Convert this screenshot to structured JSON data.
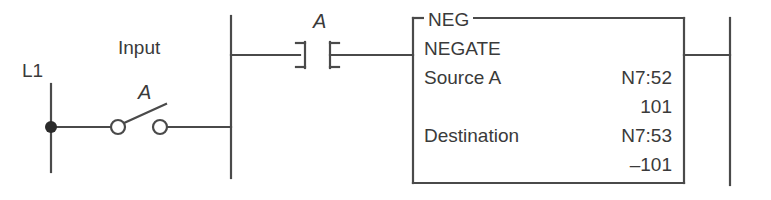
{
  "diagram": {
    "stroke_color": "#4a4a4a",
    "text_color": "#3a3a3a",
    "background_color": "#ffffff"
  },
  "field_circuit": {
    "power_rail_label": "L1",
    "input_label": "Input",
    "switch_label": "A",
    "switch_type": "normally-open-toggle-switch",
    "terminal_dot": "filled-junction-dot"
  },
  "rung": {
    "contact_label": "A",
    "contact_type": "examine-if-closed"
  },
  "instruction_block": {
    "mnemonic": "NEG",
    "name": "NEGATE",
    "rows": [
      {
        "label": "Source A",
        "address": "N7:52",
        "value": "101"
      },
      {
        "label": "Destination",
        "address": "N7:53",
        "value": "–101"
      }
    ]
  }
}
